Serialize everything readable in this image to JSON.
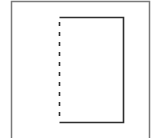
{
  "diagram": {
    "type": "line-drawing",
    "colors": {
      "background": "#ffffff",
      "outer_frame": "#7a7a7a",
      "inner_lines": "#2e2e2e"
    },
    "outer_frame": {
      "x": 11,
      "y": 1,
      "width": 139,
      "height": 137,
      "stroke_width": 1.5
    },
    "inner_rect": {
      "left": 59.5,
      "top": 17.5,
      "right": 123.5,
      "bottom": 122.5,
      "stroke_width": 1.6,
      "left_side_style": "dashed",
      "dash": "4 6"
    }
  }
}
